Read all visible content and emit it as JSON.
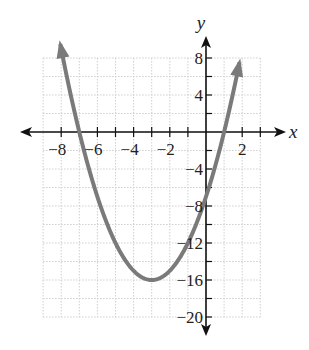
{
  "chart_data": {
    "type": "line",
    "title": "",
    "function": "y = x^2 + 6x - 7",
    "xlabel": "x",
    "ylabel": "y",
    "xlim": [
      -9,
      3
    ],
    "ylim": [
      -20,
      8
    ],
    "grid": true,
    "x_grid_step": 1,
    "y_grid_step": 2,
    "x_tick_labels": [
      "-8",
      "-6",
      "-4",
      "-2",
      "2"
    ],
    "x_ticks": [
      -8,
      -6,
      -4,
      -2,
      2
    ],
    "y_tick_labels": [
      "8",
      "4",
      "-4",
      "-8",
      "-12",
      "-16",
      "-20"
    ],
    "y_ticks": [
      8,
      4,
      -4,
      -8,
      -12,
      -16,
      -20
    ],
    "vertex": [
      -3,
      -16
    ],
    "x_intercepts": [
      -7,
      1
    ],
    "y_intercept": -7,
    "x_range_plotted": [
      -8.05,
      1.85
    ],
    "curve_color": "#7a7a7a",
    "grid_color": "#cfcfcf",
    "axis_color": "#111111"
  },
  "labels": {
    "x_axis": "x",
    "y_axis": "y",
    "x_ticks": [
      "−8",
      "−6",
      "−4",
      "−2",
      "2"
    ],
    "y_ticks": [
      "8",
      "4",
      "−4",
      "−8",
      "−12",
      "−16",
      "−20"
    ]
  }
}
